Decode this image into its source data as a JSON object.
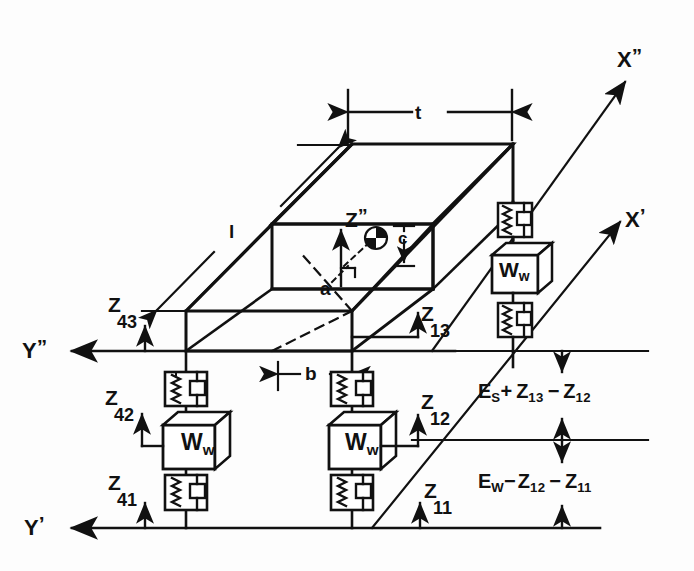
{
  "figure": {
    "type": "engineering-schematic",
    "colors": {
      "ink": "#111111",
      "paper": "#fdfdfd"
    }
  },
  "axes": [
    {
      "id": "x-double-prime",
      "label": "X",
      "prime": "”"
    },
    {
      "id": "x-prime",
      "label": "X",
      "prime": "’"
    },
    {
      "id": "y-double-prime",
      "label": "Y",
      "prime": "”"
    },
    {
      "id": "y-prime",
      "label": "Y",
      "prime": "’"
    },
    {
      "id": "z-double-prime",
      "label": "Z",
      "prime": "”"
    }
  ],
  "dimensions": [
    {
      "id": "t",
      "label": "t"
    },
    {
      "id": "l",
      "label": "l"
    },
    {
      "id": "b",
      "label": "b"
    },
    {
      "id": "c",
      "label": "c"
    },
    {
      "id": "a",
      "label": "a"
    }
  ],
  "coordinate_labels": [
    {
      "id": "z43",
      "base": "Z",
      "sub": "43"
    },
    {
      "id": "z42",
      "base": "Z",
      "sub": "42"
    },
    {
      "id": "z41",
      "base": "Z",
      "sub": "41"
    },
    {
      "id": "z13",
      "base": "Z",
      "sub": "13"
    },
    {
      "id": "z12",
      "base": "Z",
      "sub": "12"
    },
    {
      "id": "z11",
      "base": "Z",
      "sub": "11"
    }
  ],
  "mass_blocks": [
    {
      "id": "mass-left",
      "base": "W",
      "sub": "w"
    },
    {
      "id": "mass-center",
      "base": "W",
      "sub": "w"
    },
    {
      "id": "mass-right",
      "base": "W",
      "sub": "w"
    }
  ],
  "equations": [
    {
      "id": "upper-gap",
      "parts": [
        {
          "t": "E",
          "sub": "S"
        },
        {
          "t": "+",
          "sub": ""
        },
        {
          "t": "Z",
          "sub": "13"
        },
        {
          "t": "−",
          "sub": ""
        },
        {
          "t": "Z",
          "sub": "12"
        }
      ],
      "plain": "E_S + Z_13 − Z_12"
    },
    {
      "id": "lower-gap",
      "parts": [
        {
          "t": "E",
          "sub": "W"
        },
        {
          "t": "−",
          "sub": ""
        },
        {
          "t": "Z",
          "sub": "12"
        },
        {
          "t": "−",
          "sub": ""
        },
        {
          "t": "Z",
          "sub": "11"
        }
      ],
      "plain": "E_W − Z_12 − Z_11"
    }
  ],
  "components": {
    "spring_damper_count": 6,
    "mass_block_count": 3,
    "center_of_gravity_marker": "cg-symbol"
  }
}
